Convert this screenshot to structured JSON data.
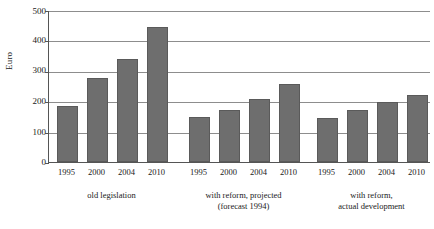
{
  "chart_data": {
    "type": "bar",
    "title": "",
    "xlabel": "",
    "ylabel": "Euro",
    "ylim": [
      0,
      500
    ],
    "yticks": [
      0,
      100,
      200,
      300,
      400,
      500
    ],
    "grid": true,
    "legend": "none",
    "categories": [
      "1995",
      "2000",
      "2004",
      "2010"
    ],
    "groups": [
      {
        "caption_lines": [
          "old legislation"
        ],
        "categories": [
          "1995",
          "2000",
          "2004",
          "2010"
        ],
        "values": [
          185,
          275,
          340,
          445
        ]
      },
      {
        "caption_lines": [
          "with reform, projected",
          "(forecast 1994)"
        ],
        "categories": [
          "1995",
          "2000",
          "2004",
          "2010"
        ],
        "values": [
          147,
          172,
          207,
          258
        ]
      },
      {
        "caption_lines": [
          "with reform,",
          "actual development"
        ],
        "categories": [
          "1995",
          "2000",
          "2004",
          "2010"
        ],
        "values": [
          145,
          172,
          198,
          220
        ]
      }
    ],
    "bar_color": "#6e6e6e",
    "axis_color": "#555555",
    "grid_color": "#8d8d8d"
  },
  "axis": {
    "y_title": "Euro",
    "y_labels": [
      "500",
      "400",
      "300",
      "200",
      "100",
      "0"
    ]
  }
}
